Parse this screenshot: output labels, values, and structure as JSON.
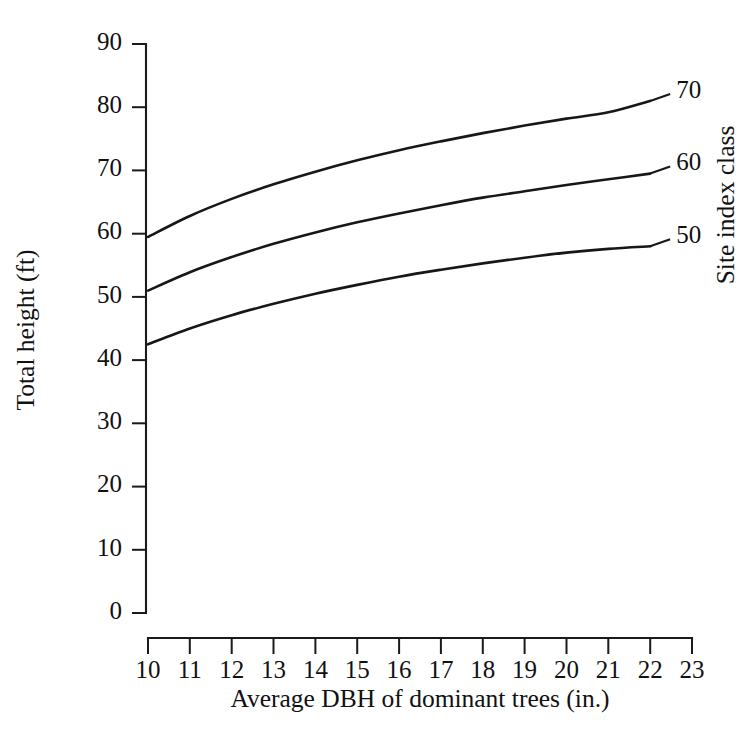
{
  "chart_data": {
    "type": "line",
    "title": "",
    "xlabel": "Average DBH of dominant trees (in.)",
    "ylabel": "Total height (ft)",
    "xlim": [
      10,
      23
    ],
    "ylim": [
      0,
      90
    ],
    "xticks": [
      10,
      11,
      12,
      13,
      14,
      15,
      16,
      17,
      18,
      19,
      20,
      21,
      22,
      23
    ],
    "yticks": [
      0,
      10,
      20,
      30,
      40,
      50,
      60,
      70,
      80,
      90
    ],
    "xtick_labels": [
      "10",
      "11",
      "12",
      "13",
      "14",
      "15",
      "16",
      "17",
      "18",
      "19",
      "20",
      "21",
      "22",
      "23"
    ],
    "ytick_labels": [
      "0",
      "10",
      "20",
      "30",
      "40",
      "50",
      "60",
      "70",
      "80",
      "90"
    ],
    "grid": false,
    "legend_position": "right-of-curve-ends",
    "legend_title": "Site index class",
    "x": [
      10,
      11,
      12,
      13,
      14,
      15,
      16,
      17,
      18,
      19,
      20,
      21,
      22
    ],
    "series": [
      {
        "name": "70",
        "label": "70",
        "color": "#17171a",
        "values": [
          59.5,
          62.8,
          65.5,
          67.8,
          69.8,
          71.6,
          73.2,
          74.6,
          75.9,
          77.1,
          78.2,
          79.2,
          81.0
        ]
      },
      {
        "name": "60",
        "label": "60",
        "color": "#17171a",
        "values": [
          51.0,
          53.9,
          56.3,
          58.4,
          60.2,
          61.8,
          63.2,
          64.5,
          65.7,
          66.7,
          67.7,
          68.6,
          69.5
        ]
      },
      {
        "name": "50",
        "label": "50",
        "color": "#17171a",
        "values": [
          42.5,
          45.0,
          47.1,
          48.9,
          50.5,
          51.9,
          53.2,
          54.3,
          55.3,
          56.2,
          57.0,
          57.6,
          58.0
        ]
      }
    ]
  },
  "axes": {
    "y_title": "Total height (ft)",
    "x_title": "Average DBH of dominant trees (in.)"
  },
  "legend": {
    "title": "Site index class",
    "entries": [
      {
        "label": "70"
      },
      {
        "label": "60"
      },
      {
        "label": "50"
      }
    ]
  }
}
